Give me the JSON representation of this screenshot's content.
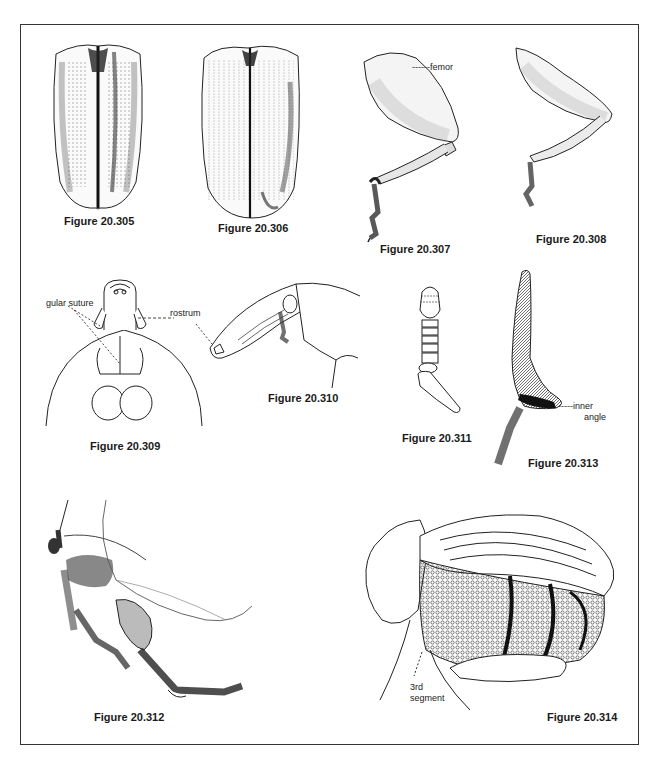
{
  "page": {
    "header_page_number": "",
    "frame": true
  },
  "figures": [
    {
      "id": "20.305",
      "caption": "Figure 20.305",
      "subject": "elytra dorsal view, striate-punctate with raised intervals"
    },
    {
      "id": "20.306",
      "caption": "Figure 20.306",
      "subject": "elytra dorsal view, finely striate-punctate"
    },
    {
      "id": "20.307",
      "caption": "Figure 20.307",
      "subject": "hind leg with enlarged femur",
      "labels": [
        "femor"
      ]
    },
    {
      "id": "20.308",
      "caption": "Figure 20.308",
      "subject": "hind leg with enlarged femur"
    },
    {
      "id": "20.309",
      "caption": "Figure 20.309",
      "subject": "head ventral view with rostrum",
      "labels": [
        "gular suture",
        "rostrum"
      ]
    },
    {
      "id": "20.310",
      "caption": "Figure 20.310",
      "subject": "head lateral view with rostrum and antenna"
    },
    {
      "id": "20.311",
      "caption": "Figure 20.311",
      "subject": "antenna, clubbed"
    },
    {
      "id": "20.312",
      "caption": "Figure 20.312",
      "subject": "legs and wing, lateral"
    },
    {
      "id": "20.313",
      "caption": "Figure 20.313",
      "subject": "tibia with inner angle",
      "labels": [
        "inner angle"
      ]
    },
    {
      "id": "20.314",
      "caption": "Figure 20.314",
      "subject": "body lateral view with sculptured surface",
      "labels": [
        "3rd segment"
      ]
    }
  ],
  "labels": {
    "femor": "femor",
    "gular_suture": "gular suture",
    "rostrum": "rostrum",
    "inner": "inner",
    "angle": "angle",
    "third": "3rd",
    "segment": "segment"
  }
}
